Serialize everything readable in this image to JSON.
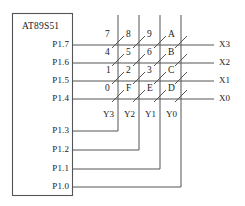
{
  "diagram": {
    "mcu": {
      "name": "AT89S51",
      "ports": [
        {
          "label": "P1.7",
          "role": "row-drive-3"
        },
        {
          "label": "P1.6",
          "role": "row-drive-2"
        },
        {
          "label": "P1.5",
          "role": "row-drive-1"
        },
        {
          "label": "P1.4",
          "role": "row-drive-0"
        },
        {
          "label": "P1.3",
          "role": "col-scan-3"
        },
        {
          "label": "P1.2",
          "role": "col-scan-2"
        },
        {
          "label": "P1.1",
          "role": "col-scan-1"
        },
        {
          "label": "P1.0",
          "role": "col-scan-0"
        }
      ]
    },
    "row_outputs": [
      {
        "label": "X3"
      },
      {
        "label": "X2"
      },
      {
        "label": "X1"
      },
      {
        "label": "X0"
      }
    ],
    "column_labels": [
      {
        "label": "Y3"
      },
      {
        "label": "Y2"
      },
      {
        "label": "Y1"
      },
      {
        "label": "Y0"
      }
    ],
    "keys": [
      [
        "7",
        "8",
        "9",
        "A"
      ],
      [
        "4",
        "5",
        "6",
        "B"
      ],
      [
        "1",
        "2",
        "3",
        "C"
      ],
      [
        "0",
        "F",
        "E",
        "D"
      ]
    ],
    "colors": {
      "line": "#555555",
      "text": "#1a1a1a",
      "background": "#ffffff"
    }
  }
}
